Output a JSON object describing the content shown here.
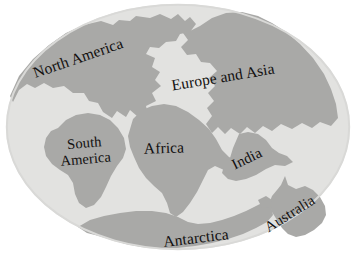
{
  "figure": {
    "kind": "pangaea-supercontinent-map",
    "caption": ""
  },
  "colors": {
    "background": "#ffffff",
    "ocean": "#e2e2e0",
    "ocean_edge": "#d9d9d7",
    "land": "#a9a9a7",
    "land_shade": "#9e9e9c",
    "label_text": "#12100f"
  },
  "globe": {
    "shape": "ellipse",
    "center_x": 178,
    "center_y": 127,
    "radius_x": 172,
    "radius_y": 123
  },
  "labels": {
    "north_america": "North America",
    "europe_and_asia": "Europe and Asia",
    "south_america_line1": "South",
    "south_america_line2": "America",
    "africa": "Africa",
    "india": "India",
    "australia": "Australia",
    "antarctica": "Antarctica"
  },
  "landmasses": [
    {
      "name": "north-america",
      "label": "North America"
    },
    {
      "name": "europe-and-asia",
      "label": "Europe and Asia"
    },
    {
      "name": "south-america",
      "label": "South America"
    },
    {
      "name": "africa",
      "label": "Africa"
    },
    {
      "name": "india",
      "label": "India"
    },
    {
      "name": "australia",
      "label": "Australia"
    },
    {
      "name": "antarctica",
      "label": "Antarctica"
    }
  ]
}
